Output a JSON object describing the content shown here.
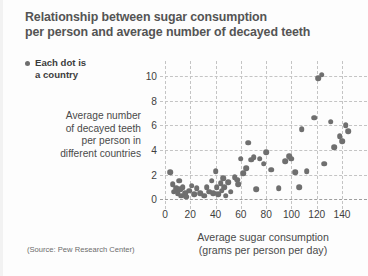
{
  "title": {
    "line1": "Relationship between sugar consumption",
    "line2": "per person and average number of decayed teeth"
  },
  "legend": {
    "marker": "legend-dot",
    "line1": "Each dot is",
    "line2": "a country"
  },
  "ylabel": {
    "line1": "Average number",
    "line2": "of decayed teeth",
    "line3": "per person in",
    "line4": "different countries"
  },
  "xlabel": {
    "line1": "Average sugar consumption",
    "line2": "(grams per person per day)"
  },
  "source": "(Source: Pew Research Center)",
  "colors": {
    "dot": "#6f6f6f",
    "grid": "#c4c4c4",
    "title": "#545454",
    "text": "#4a4a4a",
    "background": "#fdfdfd"
  },
  "chart_data": {
    "type": "scatter",
    "title": "Relationship between sugar consumption per person and average number of decayed teeth",
    "xlabel": "Average sugar consumption (grams per person per day)",
    "ylabel": "Average number of decayed teeth per person in different countries",
    "legend": "Each dot is a country",
    "source": "Pew Research Center",
    "grid": true,
    "legend_position": "top-left",
    "xlim": [
      0,
      155
    ],
    "ylim": [
      -0.3,
      10.8
    ],
    "xticks": [
      0,
      20,
      40,
      60,
      80,
      100,
      120,
      140
    ],
    "yticks": [
      0,
      2,
      4,
      6,
      8,
      10
    ],
    "series": [
      {
        "name": "Each dot is a country",
        "points": [
          [
            4,
            2.2
          ],
          [
            6,
            1.2
          ],
          [
            7,
            0.6
          ],
          [
            9,
            0.9
          ],
          [
            10,
            0.5
          ],
          [
            11,
            1.5
          ],
          [
            12,
            0.8
          ],
          [
            13,
            0.3
          ],
          [
            14,
            1.0
          ],
          [
            16,
            0.5
          ],
          [
            17,
            0.2
          ],
          [
            19,
            0.7
          ],
          [
            21,
            1.1
          ],
          [
            23,
            0.4
          ],
          [
            25,
            0.9
          ],
          [
            28,
            0.5
          ],
          [
            31,
            0.3
          ],
          [
            33,
            1.0
          ],
          [
            35,
            0.6
          ],
          [
            37,
            1.5
          ],
          [
            38,
            0.5
          ],
          [
            40,
            2.3
          ],
          [
            41,
            1.0
          ],
          [
            42,
            0.4
          ],
          [
            44,
            1.3
          ],
          [
            45,
            0.7
          ],
          [
            46,
            1.7
          ],
          [
            47,
            1.0
          ],
          [
            48,
            0.3
          ],
          [
            50,
            1.4
          ],
          [
            52,
            0.6
          ],
          [
            55,
            1.8
          ],
          [
            57,
            1.6
          ],
          [
            58,
            1.2
          ],
          [
            60,
            3.3
          ],
          [
            62,
            2.1
          ],
          [
            64,
            2.5
          ],
          [
            66,
            4.6
          ],
          [
            68,
            3.2
          ],
          [
            70,
            3.4
          ],
          [
            72,
            0.8
          ],
          [
            75,
            3.3
          ],
          [
            78,
            2.9
          ],
          [
            80,
            3.8
          ],
          [
            84,
            2.4
          ],
          [
            90,
            0.9
          ],
          [
            95,
            3.1
          ],
          [
            98,
            3.5
          ],
          [
            100,
            3.3
          ],
          [
            103,
            2.2
          ],
          [
            106,
            1.0
          ],
          [
            108,
            5.7
          ],
          [
            112,
            2.3
          ],
          [
            118,
            6.6
          ],
          [
            121,
            9.8
          ],
          [
            124,
            10.1
          ],
          [
            126,
            2.9
          ],
          [
            131,
            6.3
          ],
          [
            134,
            4.2
          ],
          [
            138,
            5.1
          ],
          [
            140,
            4.7
          ],
          [
            143,
            6.0
          ],
          [
            145,
            5.5
          ]
        ]
      }
    ]
  }
}
